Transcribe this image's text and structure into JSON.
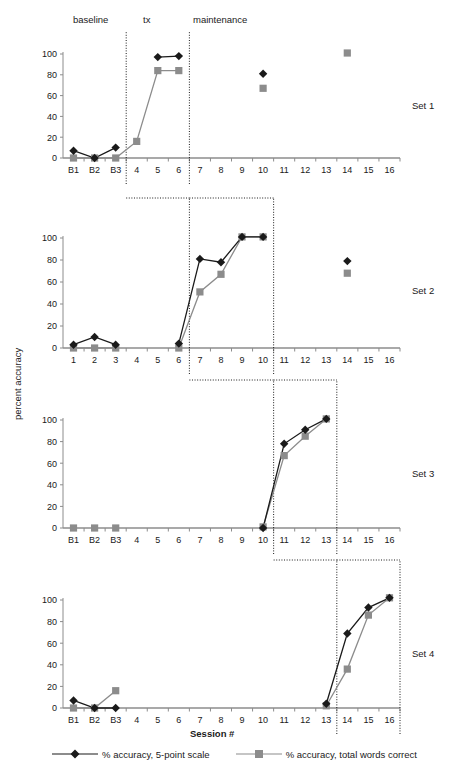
{
  "figure": {
    "y_axis_title": "percent accuracy",
    "x_axis_title": "Session #",
    "phases": [
      {
        "name": "baseline",
        "label": "baseline"
      },
      {
        "name": "tx",
        "label": "tx"
      },
      {
        "name": "maintenance",
        "label": "maintenance"
      }
    ],
    "panel_labels": [
      "Set 1",
      "Set 2",
      "Set 3",
      "Set 4"
    ],
    "legend": [
      {
        "label": "% accuracy, 5-point scale",
        "marker": "diamond",
        "color": "#1a1a1a"
      },
      {
        "label": "% accuracy, total words correct",
        "marker": "square",
        "color": "#8c8c8c"
      }
    ],
    "colors": {
      "series_diamond": "#1a1a1a",
      "series_square": "#8c8c8c",
      "axis": "#8c8c8c",
      "phase_line": "#1a1a1a",
      "text": "#1a1a1a"
    },
    "y_ticks": [
      0,
      20,
      40,
      60,
      80,
      100
    ],
    "y_tick_labels": [
      "0",
      "20",
      "40",
      "60",
      "80",
      "100"
    ]
  },
  "chart_data": [
    {
      "type": "line",
      "title": "Set 1",
      "xlabel": "Session #",
      "ylabel": "percent accuracy",
      "ylim": [
        0,
        100
      ],
      "grid": false,
      "legend_position": "bottom",
      "categories": [
        "B1",
        "B2",
        "B3",
        "4",
        "5",
        "6",
        "7",
        "8",
        "9",
        "10",
        "11",
        "12",
        "13",
        "14",
        "15",
        "16"
      ],
      "phase_breaks": [
        3,
        6
      ],
      "series": [
        {
          "name": "% accuracy, 5-point scale",
          "marker": "diamond",
          "color": "#1a1a1a",
          "values": [
            7,
            0,
            10,
            null,
            97,
            98,
            null,
            null,
            null,
            81,
            null,
            null,
            null,
            null,
            null,
            null
          ],
          "connect_segments": [
            [
              0,
              1,
              2
            ],
            [
              4,
              5
            ]
          ]
        },
        {
          "name": "% accuracy, total words correct",
          "marker": "square",
          "color": "#8c8c8c",
          "values": [
            0,
            0,
            0,
            16,
            84,
            84,
            null,
            null,
            null,
            67,
            null,
            null,
            null,
            101,
            null,
            null
          ],
          "connect_segments": [
            [
              0,
              1,
              2,
              3,
              4,
              5
            ]
          ]
        }
      ]
    },
    {
      "type": "line",
      "title": "Set 2",
      "xlabel": "Session #",
      "ylabel": "percent accuracy",
      "ylim": [
        0,
        100
      ],
      "grid": false,
      "legend_position": "bottom",
      "categories": [
        "1",
        "2",
        "3",
        "4",
        "5",
        "6",
        "7",
        "8",
        "9",
        "10",
        "11",
        "12",
        "13",
        "14",
        "15",
        "16"
      ],
      "phase_breaks": [
        6,
        10
      ],
      "series": [
        {
          "name": "% accuracy, 5-point scale",
          "marker": "diamond",
          "color": "#1a1a1a",
          "values": [
            3,
            10,
            3,
            null,
            null,
            4,
            81,
            78,
            101,
            101,
            null,
            null,
            null,
            79,
            null,
            null
          ],
          "connect_segments": [
            [
              0,
              1,
              2
            ],
            [
              5,
              6,
              7,
              8,
              9
            ]
          ]
        },
        {
          "name": "% accuracy, total words correct",
          "marker": "square",
          "color": "#8c8c8c",
          "values": [
            0,
            0,
            0,
            null,
            null,
            0,
            51,
            67,
            101,
            101,
            null,
            null,
            null,
            68,
            null,
            null
          ],
          "connect_segments": [
            [
              0,
              1,
              2
            ],
            [
              5,
              6,
              7,
              8,
              9
            ]
          ]
        }
      ]
    },
    {
      "type": "line",
      "title": "Set 3",
      "xlabel": "Session #",
      "ylabel": "percent accuracy",
      "ylim": [
        0,
        100
      ],
      "grid": false,
      "legend_position": "bottom",
      "categories": [
        "B1",
        "B2",
        "B3",
        "4",
        "5",
        "6",
        "7",
        "8",
        "9",
        "10",
        "11",
        "12",
        "13",
        "14",
        "15",
        "16"
      ],
      "phase_breaks": [
        10,
        13
      ],
      "series": [
        {
          "name": "% accuracy, 5-point scale",
          "marker": "diamond",
          "color": "#1a1a1a",
          "values": [
            null,
            null,
            null,
            null,
            null,
            null,
            null,
            null,
            null,
            0,
            78,
            91,
            101,
            null,
            null,
            null
          ],
          "connect_segments": [
            [
              9,
              10,
              11,
              12
            ]
          ]
        },
        {
          "name": "% accuracy, total words correct",
          "marker": "square",
          "color": "#8c8c8c",
          "values": [
            0,
            0,
            0,
            null,
            null,
            null,
            null,
            null,
            null,
            1,
            67,
            85,
            101,
            null,
            null,
            null
          ],
          "connect_segments": [
            [
              9,
              10,
              11,
              12
            ]
          ]
        }
      ]
    },
    {
      "type": "line",
      "title": "Set 4",
      "xlabel": "Session #",
      "ylabel": "percent accuracy",
      "ylim": [
        0,
        100
      ],
      "grid": false,
      "legend_position": "bottom",
      "categories": [
        "B1",
        "B2",
        "B3",
        "4",
        "5",
        "6",
        "7",
        "8",
        "9",
        "10",
        "11",
        "12",
        "13",
        "14",
        "15",
        "16"
      ],
      "phase_breaks": [
        13,
        16
      ],
      "series": [
        {
          "name": "% accuracy, 5-point scale",
          "marker": "diamond",
          "color": "#1a1a1a",
          "values": [
            7,
            0,
            0,
            null,
            null,
            null,
            null,
            null,
            null,
            null,
            null,
            null,
            4,
            69,
            93,
            102
          ],
          "connect_segments": [
            [
              0,
              1,
              2
            ],
            [
              12,
              13,
              14,
              15
            ]
          ]
        },
        {
          "name": "% accuracy, total words correct",
          "marker": "square",
          "color": "#8c8c8c",
          "values": [
            0,
            0,
            16,
            null,
            null,
            null,
            null,
            null,
            null,
            null,
            null,
            null,
            2,
            36,
            86,
            102
          ],
          "connect_segments": [
            [
              0,
              1,
              2
            ],
            [
              12,
              13,
              14,
              15
            ]
          ]
        }
      ]
    }
  ]
}
